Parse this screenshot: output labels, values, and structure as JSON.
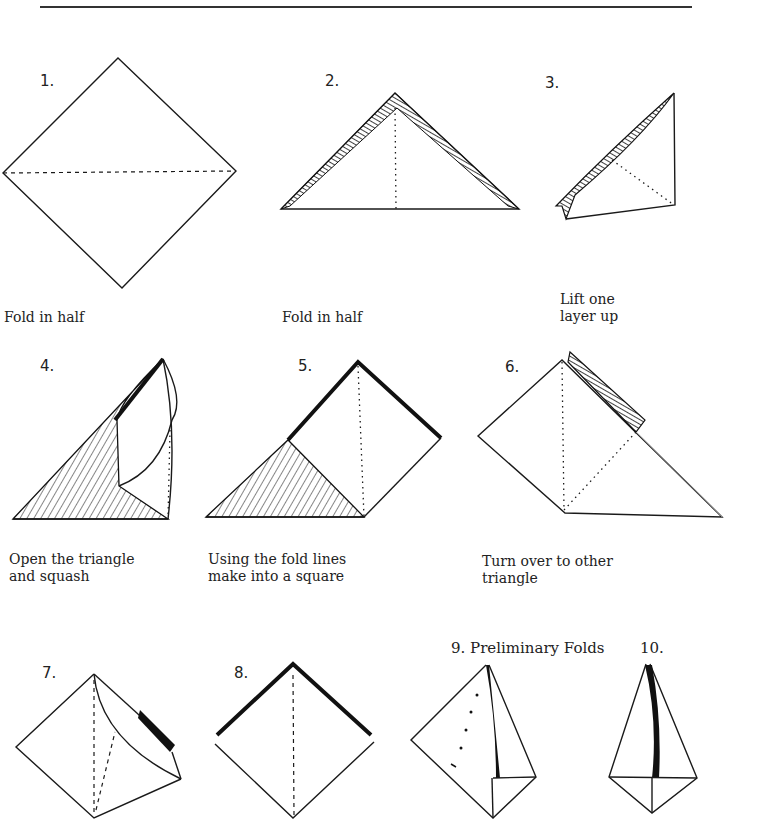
{
  "page": {
    "header_fragment": "PLACE IN THE ABSENCE OF GOD"
  },
  "steps": [
    {
      "number": "1.",
      "caption": "Fold in half"
    },
    {
      "number": "2.",
      "caption": "Fold in half"
    },
    {
      "number": "3.",
      "caption": "Lift one\nlayer up"
    },
    {
      "number": "4.",
      "caption": "Open the triangle\nand squash"
    },
    {
      "number": "5.",
      "caption": "Using the fold lines\nmake into a square"
    },
    {
      "number": "6.",
      "caption": "Turn over to other\ntriangle"
    },
    {
      "number": "7.",
      "caption": ""
    },
    {
      "number": "8.",
      "caption": ""
    },
    {
      "number": "9. Preliminary Folds",
      "caption": ""
    },
    {
      "number": "10.",
      "caption": ""
    }
  ],
  "colors": {
    "ink": "#1a1a1a",
    "paper": "#ffffff"
  }
}
